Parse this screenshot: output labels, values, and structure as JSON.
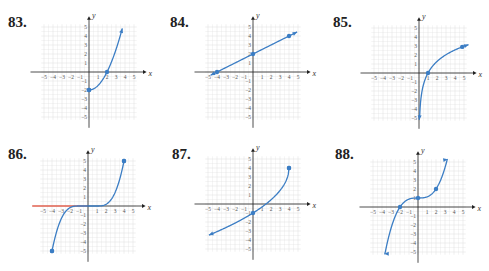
{
  "page": {
    "background": "#ffffff",
    "curve_color": "#3b7dc4",
    "grid_color": "#dcdcdc",
    "axis_color": "#222222",
    "highlight_color": "#e0614f"
  },
  "axes": {
    "x_label": "x",
    "y_label": "y",
    "x_ticks": [
      "−5",
      "−4",
      "−3",
      "−2",
      "−1",
      "1",
      "2",
      "3",
      "4",
      "5"
    ],
    "y_ticks": [
      "5",
      "4",
      "3",
      "2",
      "1",
      "−1",
      "−2",
      "−3",
      "−4",
      "−5"
    ],
    "range": [
      -5,
      5
    ]
  },
  "problems": [
    {
      "number": "83.",
      "label_pos": [
        8,
        14
      ],
      "origin": [
        89,
        72
      ],
      "unit": 9.0,
      "description": "Increasing curve starting at (0,-2), passing (2,0), arrow upward",
      "curve": {
        "type": "function",
        "fn": "quad83",
        "x_start": 0,
        "x_end": 3.7,
        "start_cap": "dot",
        "end_cap": "arrow"
      },
      "points": [
        [
          0,
          -2
        ],
        [
          2,
          0
        ]
      ]
    },
    {
      "number": "84.",
      "label_pos": [
        170,
        14
      ],
      "origin": [
        253,
        72
      ],
      "unit": 9.0,
      "description": "Line through (-4,0), (0,2), (4,4) with arrows both ends",
      "curve": {
        "type": "function",
        "fn": "line84",
        "x_start": -4.7,
        "x_end": 4.9,
        "start_cap": "arrow",
        "end_cap": "arrow"
      },
      "points": [
        [
          -4,
          0
        ],
        [
          0,
          2
        ],
        [
          4,
          4
        ]
      ]
    },
    {
      "number": "85.",
      "label_pos": [
        333,
        14
      ],
      "origin": [
        419,
        73
      ],
      "unit": 9.0,
      "description": "Logarithmic curve through (1,0) and (5,3), vertical asymptote at x=0",
      "curve": {
        "type": "function",
        "fn": "log85",
        "x_start": 0.03,
        "x_end": 5.5,
        "start_cap": "arrow",
        "end_cap": "arrow"
      },
      "points": [
        [
          1,
          0
        ],
        [
          4.8,
          2.9
        ]
      ]
    },
    {
      "number": "86.",
      "label_pos": [
        8,
        146
      ],
      "origin": [
        88,
        206
      ],
      "unit": 9.0,
      "description": "Cubic-like curve from (-4,-5) to (4,5), flat between -1 and 1",
      "curve": {
        "type": "function",
        "fn": "cubic86",
        "x_start": -4,
        "x_end": 4,
        "start_cap": "dot",
        "end_cap": "dot"
      },
      "points": [
        [
          -4,
          -5
        ],
        [
          4,
          5
        ]
      ],
      "highlight_segment": {
        "x_from": -6.2,
        "x_to": 0,
        "y": 0
      }
    },
    {
      "number": "87.",
      "label_pos": [
        172,
        146
      ],
      "origin": [
        253,
        204
      ],
      "unit": 9.0,
      "description": "Increasing curve ending at (4,4), passing (0,-1), arrow toward lower left",
      "curve": {
        "type": "function",
        "fn": "root87",
        "x_start": -4.9,
        "x_end": 4,
        "start_cap": "arrow",
        "end_cap": "dot"
      },
      "points": [
        [
          0,
          -1
        ],
        [
          4,
          4
        ]
      ]
    },
    {
      "number": "88.",
      "label_pos": [
        335,
        146
      ],
      "origin": [
        418,
        207
      ],
      "unit": 9.0,
      "description": "Cubic curve y = x^3/8 + 1 through (-2,0), (0,1), (2,2) with arrows",
      "curve": {
        "type": "function",
        "fn": "cubic88",
        "x_start": -3.75,
        "x_end": 3.3,
        "start_cap": "arrow",
        "end_cap": "arrow"
      },
      "points": [
        [
          -2,
          0
        ],
        [
          0,
          1
        ],
        [
          2,
          2
        ]
      ]
    }
  ]
}
